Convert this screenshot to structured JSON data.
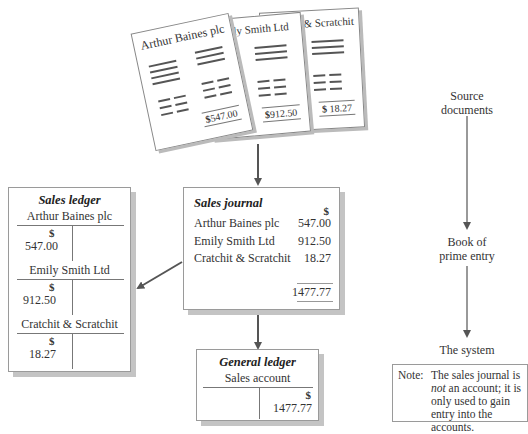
{
  "source_documents": [
    {
      "title": "Arthur Baines plc",
      "amount": "547.00",
      "currency": "$"
    },
    {
      "title": "Emily Smith Ltd",
      "amount": "912.50",
      "currency": "$"
    },
    {
      "title": "Cratchit & Scratchit",
      "amount": "18.27",
      "currency": "$"
    }
  ],
  "sales_journal": {
    "title": "Sales journal",
    "currency": "$",
    "rows": [
      {
        "name": "Arthur Baines plc",
        "amount": "547.00"
      },
      {
        "name": "Emily Smith Ltd",
        "amount": "912.50"
      },
      {
        "name": "Cratchit & Scratchit",
        "amount": "18.27"
      }
    ],
    "total": "1477.77"
  },
  "sales_ledger": {
    "title": "Sales ledger",
    "accounts": [
      {
        "name": "Arthur Baines plc",
        "currency": "$",
        "debit": "547.00"
      },
      {
        "name": "Emily Smith Ltd",
        "currency": "$",
        "debit": "912.50"
      },
      {
        "name": "Cratchit & Scratchit",
        "currency": "$",
        "debit": "18.27"
      }
    ]
  },
  "general_ledger": {
    "title": "General ledger",
    "account": "Sales account",
    "currency": "$",
    "credit": "1477.77"
  },
  "flow": {
    "step1": "Source documents",
    "step1_line1": "Source",
    "step1_line2": "documents",
    "step2_line1": "Book of",
    "step2_line2": "prime entry",
    "step3": "The system"
  },
  "note": {
    "label": "Note:",
    "text_pre": "The sales journal is ",
    "text_em": "not",
    "text_post": " an account; it is only used to gain entry into the accounts."
  }
}
